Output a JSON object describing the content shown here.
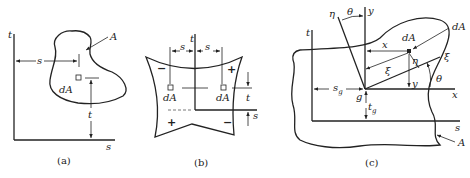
{
  "figure": {
    "panels": [
      {
        "id": "a",
        "caption": "(a)",
        "labels": {
          "axis_t": "t",
          "axis_s": "s",
          "area": "A",
          "element": "dA",
          "dim_s": "s",
          "dim_t": "t"
        }
      },
      {
        "id": "b",
        "caption": "(b)",
        "labels": {
          "axis_t": "t",
          "dim_s_left": "s",
          "dim_s_right": "s",
          "element_left": "dA",
          "element_right": "dA",
          "dim_t": "t",
          "dim_s": "s"
        },
        "signs": {
          "top_left": "−",
          "top_right": "+",
          "bottom_left": "+",
          "bottom_right": "−"
        }
      },
      {
        "id": "c",
        "caption": "(c)",
        "labels": {
          "axis_t": "t",
          "axis_s": "s",
          "axis_y": "y",
          "axis_x": "x",
          "axis_eta": "η",
          "axis_xi": "ξ",
          "angle_top": "θ",
          "angle_right": "θ",
          "element": "dA",
          "element_pointer": "dA",
          "dim_x": "x",
          "dim_y": "y",
          "dim_xi": "ξ",
          "dim_eta": "η",
          "centroid": "g",
          "dim_sg": "s",
          "dim_sg_sub": "g",
          "dim_tg": "t",
          "dim_tg_sub": "g",
          "area": "A"
        }
      }
    ]
  },
  "colors": {
    "ink": "#222222",
    "background": "#ffffff"
  }
}
